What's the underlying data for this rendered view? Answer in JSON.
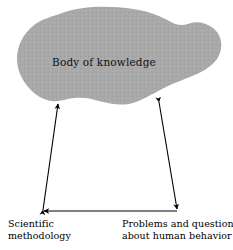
{
  "figure": {
    "type": "concept-diagram",
    "background_color": "#ffffff",
    "blob": {
      "label": "Body of knowledge",
      "fill_color": "#a9a9a9",
      "pattern": "halftone-dither"
    },
    "captions": {
      "left": {
        "name": "scientific-methodology",
        "line1": "Scientific",
        "line2": "methodology"
      },
      "right": {
        "name": "problems-and-questions",
        "line1": "Problems and questions",
        "line2": "about human behavior"
      }
    },
    "connectors": [
      {
        "name": "left-diagonal-arrow",
        "from": "bottom-left-vertex",
        "to": "blob-bottom-left",
        "arrowheads": "both",
        "color": "#000000"
      },
      {
        "name": "right-diagonal-arrow",
        "from": "bottom-right-vertex",
        "to": "blob-bottom-right",
        "arrowheads": "both",
        "color": "#000000"
      },
      {
        "name": "baseline-arrow",
        "from": "bottom-right-vertex",
        "to": "bottom-left-vertex",
        "arrowheads": "left",
        "color": "#000000"
      }
    ]
  }
}
